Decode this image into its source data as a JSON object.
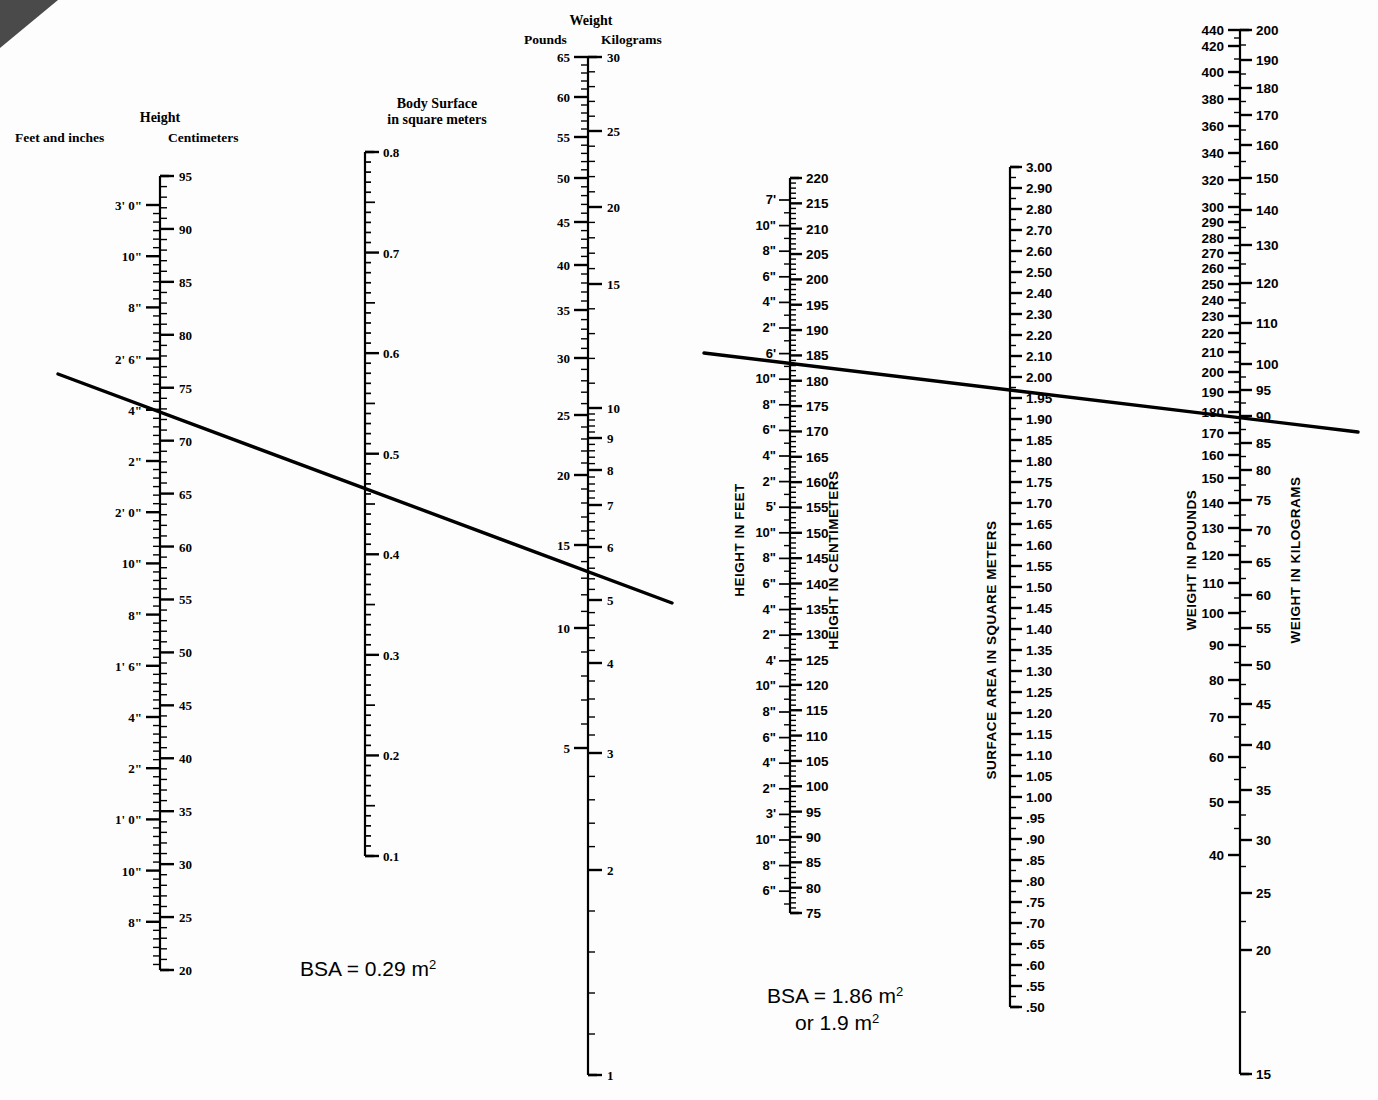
{
  "left_nomogram": {
    "height_header": {
      "title": "Height",
      "left_label": "Feet and inches",
      "right_label": "Centimeters"
    },
    "bsa_header": {
      "line1": "Body Surface",
      "line2": "in square meters"
    },
    "weight_header": {
      "title": "Weight",
      "left_label": "Pounds",
      "right_label": "Kilograms"
    },
    "height_cm_ticks": [
      "95",
      "90",
      "85",
      "80",
      "75",
      "70",
      "65",
      "60",
      "55",
      "50",
      "45",
      "40",
      "35",
      "30",
      "25",
      "20"
    ],
    "height_ft_ticks": [
      "3' 0\"",
      "10\"",
      "8\"",
      "2' 6\"",
      "4\"",
      "2\"",
      "2' 0\"",
      "10\"",
      "8\"",
      "1' 6\"",
      "4\"",
      "2\"",
      "1' 0\"",
      "10\"",
      "8\""
    ],
    "bsa_ticks": [
      "0.8",
      "0.7",
      "0.6",
      "0.5",
      "0.4",
      "0.3",
      "0.2",
      "0.1"
    ],
    "weight_lb_ticks": [
      "65",
      "60",
      "55",
      "50",
      "45",
      "40",
      "35",
      "30",
      "25",
      "20",
      "15",
      "10",
      "5"
    ],
    "weight_kg_ticks": [
      "30",
      "25",
      "20",
      "15",
      "10",
      "9",
      "8",
      "7",
      "6",
      "5",
      "4",
      "3",
      "2",
      "1"
    ],
    "result": "BSA = 0.29 m",
    "result_sup": "2"
  },
  "right_nomogram": {
    "axis_labels": {
      "height_feet": "HEIGHT IN FEET",
      "height_cm": "HEIGHT IN CENTIMETERS",
      "surface_area": "SURFACE AREA IN SQUARE METERS",
      "weight_lb": "WEIGHT IN POUNDS",
      "weight_kg": "WEIGHT IN KILOGRAMS"
    },
    "height_cm_ticks": [
      "220",
      "215",
      "210",
      "205",
      "200",
      "195",
      "190",
      "185",
      "180",
      "175",
      "170",
      "165",
      "160",
      "155",
      "150",
      "145",
      "140",
      "135",
      "130",
      "125",
      "120",
      "115",
      "110",
      "105",
      "100",
      "95",
      "90",
      "85",
      "80",
      "75"
    ],
    "height_ft_ticks": [
      "7'",
      "10\"",
      "8\"",
      "6\"",
      "4\"",
      "2\"",
      "6'",
      "10\"",
      "8\"",
      "6\"",
      "4\"",
      "2\"",
      "5'",
      "10\"",
      "8\"",
      "6\"",
      "4\"",
      "2\"",
      "4'",
      "10\"",
      "8\"",
      "6\"",
      "4\"",
      "2\"",
      "3'",
      "10\"",
      "8\"",
      "6\""
    ],
    "surface_area_ticks": [
      "3.00",
      "2.90",
      "2.80",
      "2.70",
      "2.60",
      "2.50",
      "2.40",
      "2.30",
      "2.20",
      "2.10",
      "2.00",
      "1.95",
      "1.90",
      "1.85",
      "1.80",
      "1.75",
      "1.70",
      "1.65",
      "1.60",
      "1.55",
      "1.50",
      "1.45",
      "1.40",
      "1.35",
      "1.30",
      "1.25",
      "1.20",
      "1.15",
      "1.10",
      "1.05",
      "1.00",
      ".95",
      ".90",
      ".85",
      ".80",
      ".75",
      ".70",
      ".65",
      ".60",
      ".55",
      ".50"
    ],
    "weight_lb_ticks": [
      "440",
      "420",
      "400",
      "380",
      "360",
      "340",
      "320",
      "300",
      "290",
      "280",
      "270",
      "260",
      "250",
      "240",
      "230",
      "220",
      "210",
      "200",
      "190",
      "180",
      "170",
      "160",
      "150",
      "140",
      "130",
      "120",
      "110",
      "100",
      "90",
      "80",
      "70",
      "60",
      "50",
      "40"
    ],
    "weight_kg_ticks": [
      "200",
      "190",
      "180",
      "170",
      "160",
      "150",
      "140",
      "130",
      "120",
      "110",
      "100",
      "95",
      "90",
      "85",
      "80",
      "75",
      "70",
      "65",
      "60",
      "55",
      "50",
      "45",
      "40",
      "35",
      "30",
      "25",
      "20",
      "15"
    ],
    "result_line1": "BSA = 1.86 m",
    "result_line1_sup": "2",
    "result_line2": "or  1.9 m",
    "result_line2_sup": "2"
  },
  "colors": {
    "ink": "#000000",
    "paper": "#fdfdfd",
    "fold": "#4a4a4a"
  }
}
